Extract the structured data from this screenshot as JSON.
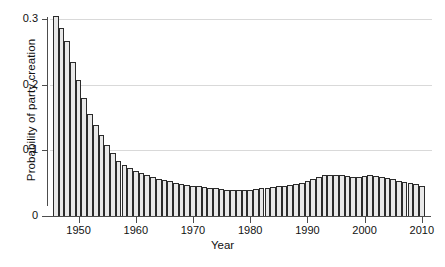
{
  "chart_data": {
    "type": "bar",
    "title": "",
    "xlabel": "Year",
    "ylabel": "Probability of party creation",
    "xlim": [
      1945.5,
      2011.0
    ],
    "ylim": [
      0,
      0.315
    ],
    "grid": true,
    "legend": null,
    "y_ticks": [
      {
        "value": 0,
        "label": "0"
      },
      {
        "value": 0.1,
        "label": "0.1"
      },
      {
        "value": 0.2,
        "label": "0.2"
      },
      {
        "value": 0.3,
        "label": "0.3"
      }
    ],
    "x_ticks": [
      {
        "value": 1950,
        "label": "1950"
      },
      {
        "value": 1960,
        "label": "1960"
      },
      {
        "value": 1970,
        "label": "1970"
      },
      {
        "value": 1980,
        "label": "1980"
      },
      {
        "value": 1990,
        "label": "1990"
      },
      {
        "value": 2000,
        "label": "2000"
      },
      {
        "value": 2010,
        "label": "2010"
      }
    ],
    "categories": [
      1946,
      1947,
      1948,
      1949,
      1950,
      1951,
      1952,
      1953,
      1954,
      1955,
      1956,
      1957,
      1958,
      1959,
      1960,
      1961,
      1962,
      1963,
      1964,
      1965,
      1966,
      1967,
      1968,
      1969,
      1970,
      1971,
      1972,
      1973,
      1974,
      1975,
      1976,
      1977,
      1978,
      1979,
      1980,
      1981,
      1982,
      1983,
      1984,
      1985,
      1986,
      1987,
      1988,
      1989,
      1990,
      1991,
      1992,
      1993,
      1994,
      1995,
      1996,
      1997,
      1998,
      1999,
      2000,
      2001,
      2002,
      2003,
      2004,
      2005,
      2006,
      2007,
      2008,
      2009,
      2010
    ],
    "values": [
      0.305,
      0.287,
      0.266,
      0.234,
      0.207,
      0.179,
      0.156,
      0.139,
      0.123,
      0.108,
      0.096,
      0.084,
      0.078,
      0.073,
      0.069,
      0.066,
      0.063,
      0.06,
      0.057,
      0.055,
      0.053,
      0.05,
      0.048,
      0.047,
      0.046,
      0.045,
      0.044,
      0.043,
      0.042,
      0.041,
      0.04,
      0.039,
      0.039,
      0.039,
      0.04,
      0.041,
      0.042,
      0.043,
      0.044,
      0.045,
      0.046,
      0.047,
      0.049,
      0.051,
      0.054,
      0.057,
      0.06,
      0.062,
      0.063,
      0.063,
      0.062,
      0.061,
      0.06,
      0.06,
      0.061,
      0.062,
      0.061,
      0.06,
      0.058,
      0.056,
      0.054,
      0.052,
      0.05,
      0.048,
      0.046
    ],
    "colors": {
      "bar_fill": "#e8e8e8",
      "bar_edge": "#2b2b2b",
      "gridline": "#d9d9d9",
      "axis": "#4d4d4d",
      "text": "#111111",
      "background": "#ffffff"
    }
  }
}
